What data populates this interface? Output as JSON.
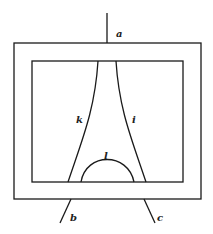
{
  "diagram": {
    "labels": {
      "a": "a",
      "b": "b",
      "c": "c",
      "k": "k",
      "i": "i",
      "l": "l"
    },
    "colors": {
      "stroke": "#1a1a1a",
      "background": "#ffffff"
    }
  }
}
